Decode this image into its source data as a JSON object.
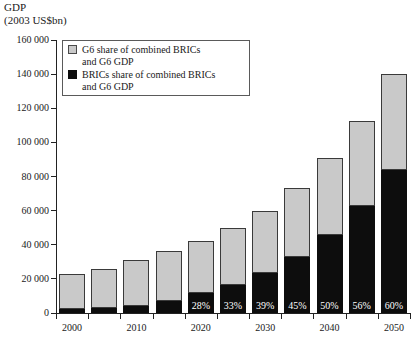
{
  "chart_data": {
    "type": "bar",
    "stacked": true,
    "title": "",
    "ylabel": "GDP",
    "ylabel_units": "(2003 US$bn)",
    "xlabel": "",
    "ylim": [
      0,
      160000
    ],
    "ytick_values": [
      0,
      20000,
      40000,
      60000,
      80000,
      100000,
      120000,
      140000,
      160000
    ],
    "ytick_labels": [
      "0",
      "20 000",
      "40 000",
      "60 000",
      "80 000",
      "100 000",
      "120 000",
      "140 000",
      "160 000"
    ],
    "grid": false,
    "legend_position": "top-left-inside",
    "categories": [
      "2000",
      "2005",
      "2010",
      "2015",
      "2020",
      "2025",
      "2030",
      "2035",
      "2040",
      "2045",
      "2050"
    ],
    "xtick_labels_shown": [
      "2000",
      "",
      "2010",
      "",
      "2020",
      "",
      "2030",
      "",
      "2040",
      "",
      "2050"
    ],
    "series": [
      {
        "name": "BRICs share of combined BRICs and G6 GDP",
        "color": "#0d0d0d",
        "values": [
          2300,
          2900,
          4400,
          7300,
          11800,
          16500,
          23400,
          33000,
          45500,
          63000,
          84000
        ]
      },
      {
        "name": "G6 share of combined BRICs and G6 GDP",
        "color": "#c9c9c9",
        "values": [
          20700,
          22700,
          26600,
          29200,
          30200,
          33500,
          36600,
          40300,
          45500,
          49500,
          56000
        ]
      }
    ],
    "totals": [
      23000,
      25600,
      31000,
      36500,
      42000,
      50000,
      60000,
      73300,
      91000,
      112500,
      140000
    ],
    "annotations": [
      {
        "category": "2000",
        "label": ""
      },
      {
        "category": "2005",
        "label": ""
      },
      {
        "category": "2010",
        "label": ""
      },
      {
        "category": "2015",
        "label": ""
      },
      {
        "category": "2020",
        "label": "28%"
      },
      {
        "category": "2025",
        "label": "33%"
      },
      {
        "category": "2030",
        "label": "39%"
      },
      {
        "category": "2035",
        "label": "45%"
      },
      {
        "category": "2040",
        "label": "50%"
      },
      {
        "category": "2045",
        "label": "56%"
      },
      {
        "category": "2050",
        "label": "60%"
      }
    ]
  },
  "legend": {
    "entries": [
      {
        "swatch": "grey",
        "line1": "G6 share of combined BRICs",
        "line2": "and G6 GDP"
      },
      {
        "swatch": "black",
        "line1": "BRICs share of combined BRICs",
        "line2": "and G6 GDP"
      }
    ]
  }
}
